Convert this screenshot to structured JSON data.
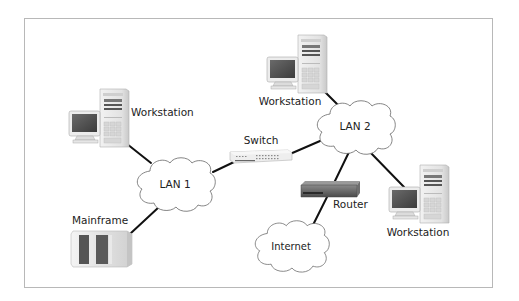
{
  "diagram": {
    "nodes": {
      "workstation_left": {
        "label": "Workstation",
        "type": "workstation"
      },
      "workstation_top": {
        "label": "Workstation",
        "type": "workstation"
      },
      "workstation_right": {
        "label": "Workstation",
        "type": "workstation"
      },
      "switch": {
        "label": "Switch",
        "type": "switch"
      },
      "lan1": {
        "label": "LAN 1",
        "type": "cloud"
      },
      "lan2": {
        "label": "LAN 2",
        "type": "cloud"
      },
      "router": {
        "label": "Router",
        "type": "router"
      },
      "internet": {
        "label": "Internet",
        "type": "cloud"
      },
      "mainframe": {
        "label": "Mainframe",
        "type": "mainframe"
      }
    },
    "edges": [
      {
        "from": "workstation_left",
        "to": "lan1"
      },
      {
        "from": "mainframe",
        "to": "lan1"
      },
      {
        "from": "lan1",
        "to": "switch"
      },
      {
        "from": "switch",
        "to": "lan2"
      },
      {
        "from": "workstation_top",
        "to": "lan2"
      },
      {
        "from": "lan2",
        "to": "router"
      },
      {
        "from": "lan2",
        "to": "workstation_right"
      },
      {
        "from": "router",
        "to": "internet"
      }
    ],
    "colors": {
      "frame_border": "#b8b8b8",
      "line": "#111111",
      "cloud_stroke": "#555555",
      "device_light": "#e8e8e8",
      "device_dark": "#555555"
    }
  }
}
